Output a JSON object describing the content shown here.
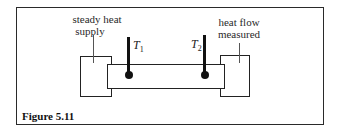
{
  "figure": {
    "caption": "Figure 5.11",
    "labels": {
      "left_box_line1": "steady heat",
      "left_box_line2": "supply",
      "right_box_line1": "heat flow",
      "right_box_line2": "measured"
    },
    "probes": [
      {
        "symbol": "T",
        "subscript": "1"
      },
      {
        "symbol": "T",
        "subscript": "2"
      }
    ]
  }
}
